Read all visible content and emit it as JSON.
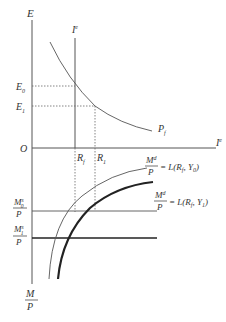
{
  "diagram": {
    "axes": {
      "vertical_top_label": "E",
      "vertical_bottom_label_num": "M",
      "vertical_bottom_label_den": "P",
      "horizontal_label": "I",
      "horizontal_label_sup": "e",
      "origin_label": "O"
    },
    "vertical_line": {
      "label": "I",
      "label_sup": "e"
    },
    "levels": {
      "e0": {
        "base": "E",
        "sub": "0"
      },
      "e1": {
        "base": "E",
        "sub": "1"
      }
    },
    "rates": {
      "rf": {
        "base": "R",
        "sub": "f"
      },
      "r1": {
        "base": "R",
        "sub": "1"
      }
    },
    "curves": {
      "pf": {
        "base": "P",
        "sub": "f"
      },
      "md0": {
        "num": "M",
        "num_sup": "d",
        "den": "P",
        "eq": "= L(R",
        "eq_sub": "f",
        "eq_rest": ",  Y",
        "y_sub": "0",
        "close": ")"
      },
      "md1": {
        "num": "M",
        "num_sup": "d",
        "den": "P",
        "eq": "= L(R",
        "eq_sub": "f",
        "eq_rest": ",  Y",
        "y_sub": "1",
        "close": ")"
      }
    },
    "money_supply": {
      "ms0": {
        "num": "M",
        "num_sup": "s",
        "num_sub": "0",
        "den": "P"
      },
      "ms1": {
        "num": "M",
        "num_sup": "s",
        "num_sub": "1",
        "den": "P"
      }
    }
  }
}
